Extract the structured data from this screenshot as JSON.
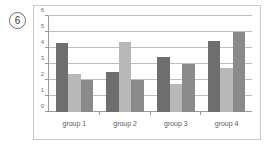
{
  "figure": {
    "marker_label": "6"
  },
  "chart_data": {
    "type": "bar",
    "title": "",
    "subtitle": "",
    "xlabel": "",
    "ylabel": "",
    "categories": [
      "group 1",
      "group 2",
      "group 3",
      "group 4"
    ],
    "series": [
      {
        "name": "series-1",
        "color": "#6e6e6e",
        "values": [
          4.3,
          2.5,
          3.45,
          4.45
        ]
      },
      {
        "name": "series-2",
        "color": "#b8b8b8",
        "values": [
          2.4,
          4.35,
          1.75,
          2.75
        ]
      },
      {
        "name": "series-3",
        "color": "#8a8a8a",
        "values": [
          2.0,
          2.0,
          3.0,
          5.0
        ]
      }
    ],
    "ylim": [
      0,
      6
    ],
    "yticks": [
      0,
      1,
      2,
      3,
      4,
      5,
      6
    ],
    "ytick_labels": [
      "0",
      "1",
      "2",
      "3",
      "4",
      "5",
      "6"
    ],
    "grid": true,
    "grid_axis": "y",
    "legend": false,
    "legend_position": "none",
    "annotations": []
  },
  "style": {
    "frame_color": "#c9c9c9",
    "axis_color": "#9a9a9a",
    "grid_color": "#bdbdbd",
    "background": "#ffffff",
    "tick_label_color": "#6f6f6f",
    "category_label_color": "#5a5a5a"
  }
}
